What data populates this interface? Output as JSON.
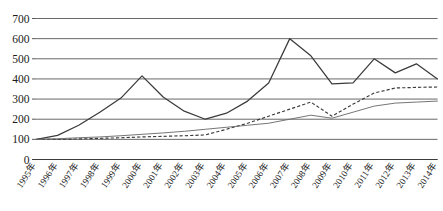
{
  "chart_data": {
    "type": "line",
    "title": "",
    "subtitle": "",
    "xlabel": "",
    "ylabel": "",
    "grid": "horizontal",
    "legend_position": "none",
    "ylim": [
      0,
      700
    ],
    "ytick_step": 100,
    "yticks": [
      "700",
      "600",
      "500",
      "400",
      "300",
      "200",
      "100",
      "0"
    ],
    "categories": [
      "1995年",
      "1996年",
      "1997年",
      "1998年",
      "1999年",
      "2000年",
      "2001年",
      "2002年",
      "2003年",
      "2004年",
      "2005年",
      "2006年",
      "2007年",
      "2008年",
      "2009年",
      "2010年",
      "2011年",
      "2012年",
      "2013年",
      "2014年"
    ],
    "series": [
      {
        "name": "series-1",
        "style": "solid",
        "values": [
          100,
          120,
          170,
          235,
          305,
          415,
          310,
          240,
          200,
          230,
          290,
          380,
          600,
          515,
          375,
          380,
          500,
          430,
          475,
          400
        ]
      },
      {
        "name": "series-2",
        "style": "dashed",
        "values": [
          100,
          100,
          102,
          105,
          108,
          112,
          115,
          118,
          122,
          150,
          180,
          215,
          250,
          285,
          215,
          275,
          330,
          355,
          358,
          360
        ]
      },
      {
        "name": "series-3",
        "style": "thin-solid",
        "values": [
          100,
          103,
          108,
          112,
          118,
          125,
          132,
          140,
          150,
          160,
          170,
          180,
          200,
          220,
          205,
          235,
          265,
          280,
          285,
          290
        ]
      }
    ]
  }
}
